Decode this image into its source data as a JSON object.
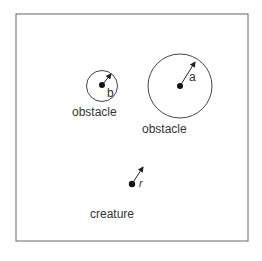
{
  "diagram": {
    "obstacle_small": {
      "label": "obstacle",
      "radius_label": "b"
    },
    "obstacle_large": {
      "label": "obstacle",
      "radius_label": "a"
    },
    "creature": {
      "label": "creature",
      "radius_label": "r"
    },
    "colors": {
      "stroke": "#444444",
      "text": "#333333",
      "background": "#ffffff"
    }
  }
}
